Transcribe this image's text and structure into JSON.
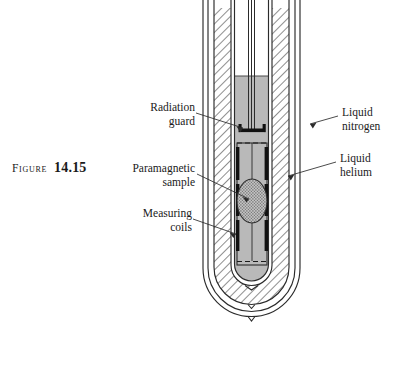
{
  "figure": {
    "caption_word": "Figure",
    "caption_number": "14.15"
  },
  "callouts": {
    "radiation_guard": {
      "line1": "Radiation",
      "line2": "guard"
    },
    "paramagnetic_sample": {
      "line1": "Paramagnetic",
      "line2": "sample"
    },
    "measuring_coils": {
      "line1": "Measuring",
      "line2": "coils"
    },
    "liquid_nitrogen": {
      "line1": "Liquid",
      "line2": "nitrogen"
    },
    "liquid_helium": {
      "line1": "Liquid",
      "line2": "helium"
    }
  },
  "colors": {
    "ink": "#1a1a1a",
    "line": "#2b2b2b",
    "helium_fill": "#b9b9b9",
    "hatch_line": "#3a3a3a",
    "sample_fill": "#9d9d9d",
    "coil_dark": "#111111",
    "page_background": "#ffffff"
  },
  "diagram": {
    "type": "cross-section",
    "parts": [
      "outer dewar wall",
      "liquid nitrogen jacket",
      "inner dewar wall",
      "liquid helium bath",
      "radiation guard",
      "sample chamber",
      "measuring coils",
      "paramagnetic sample",
      "central support tube"
    ]
  }
}
